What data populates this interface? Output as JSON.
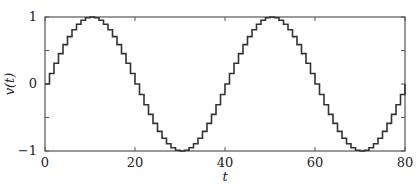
{
  "chart_data": {
    "type": "line",
    "subtype": "step",
    "title": "",
    "xlabel": "t",
    "ylabel": "v(t)",
    "xlim": [
      0,
      80
    ],
    "ylim": [
      -1,
      1
    ],
    "xticks": [
      0,
      20,
      40,
      60,
      80
    ],
    "xtick_labels": [
      "0",
      "20",
      "40",
      "60",
      "80"
    ],
    "yticks": [
      -1,
      0,
      1
    ],
    "ytick_labels": [
      "−1",
      "0",
      "1"
    ],
    "minor_yticks": [
      -0.5,
      0.5
    ],
    "grid": false,
    "legend": null,
    "series": [
      {
        "name": "v(t)",
        "description": "Sampled-and-held sine wave, period 40, unit sample interval",
        "color": "#333333",
        "x": [
          0,
          1,
          2,
          3,
          4,
          5,
          6,
          7,
          8,
          9,
          10,
          11,
          12,
          13,
          14,
          15,
          16,
          17,
          18,
          19,
          20,
          21,
          22,
          23,
          24,
          25,
          26,
          27,
          28,
          29,
          30,
          31,
          32,
          33,
          34,
          35,
          36,
          37,
          38,
          39,
          40,
          41,
          42,
          43,
          44,
          45,
          46,
          47,
          48,
          49,
          50,
          51,
          52,
          53,
          54,
          55,
          56,
          57,
          58,
          59,
          60,
          61,
          62,
          63,
          64,
          65,
          66,
          67,
          68,
          69,
          70,
          71,
          72,
          73,
          74,
          75,
          76,
          77,
          78,
          79
        ],
        "values": [
          0,
          0.156,
          0.309,
          0.454,
          0.588,
          0.707,
          0.809,
          0.891,
          0.951,
          0.988,
          1,
          0.988,
          0.951,
          0.891,
          0.809,
          0.707,
          0.588,
          0.454,
          0.309,
          0.156,
          0,
          -0.156,
          -0.309,
          -0.454,
          -0.588,
          -0.707,
          -0.809,
          -0.891,
          -0.951,
          -0.988,
          -1,
          -0.988,
          -0.951,
          -0.891,
          -0.809,
          -0.707,
          -0.588,
          -0.454,
          -0.309,
          -0.156,
          0,
          0.156,
          0.309,
          0.454,
          0.588,
          0.707,
          0.809,
          0.891,
          0.951,
          0.988,
          1,
          0.988,
          0.951,
          0.891,
          0.809,
          0.707,
          0.588,
          0.454,
          0.309,
          0.156,
          0,
          -0.156,
          -0.309,
          -0.454,
          -0.588,
          -0.707,
          -0.809,
          -0.891,
          -0.951,
          -0.988,
          -1,
          -0.988,
          -0.951,
          -0.891,
          -0.809,
          -0.707,
          -0.588,
          -0.454,
          -0.309,
          -0.156
        ]
      }
    ]
  },
  "layout": {
    "plot_left": 45,
    "plot_right": 405,
    "plot_top": 17,
    "plot_bottom": 151,
    "axis_color": "#555555",
    "line_color": "#333333"
  }
}
